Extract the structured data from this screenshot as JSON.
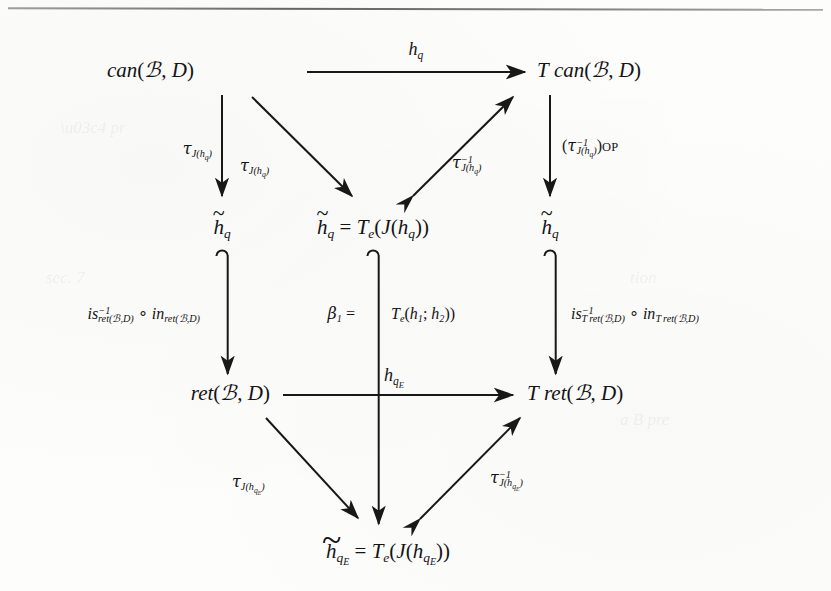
{
  "figure": {
    "kind": "commutative-diagram",
    "top_rule": true,
    "nodes": {
      "can": "can(ℐ, D)",
      "tcan": "T can(ℐ, D)",
      "h_tilde_left": "h̃q",
      "h_tilde_center": "h̃q = Te(J(hq))",
      "h_tilde_right": "h̃q",
      "ret": "ret(ℐ, D)",
      "tret": "T ret(ℐ, D)",
      "h_tilde_bottom": "h̃qE = Te(J(hqE))"
    },
    "arrow_labels": {
      "top_horizontal": "hq",
      "left_vertical_outer": "τJ(hq)",
      "left_diagonal": "τJ(hq)",
      "right_diagonal": "τ⁻¹J(hq)",
      "right_vertical": "(τ⁻¹J(hq))OP",
      "left_inclusion": "is⁻¹ret(ℐ,D) ∘ inret(ℐ,D)",
      "center_inclusion": "β1 = Te(h1; h2))",
      "right_inclusion": "is⁻¹Tret(ℐ,D) ∘ inTret(ℐ,D)",
      "bottom_horizontal": "hqE",
      "bottom_left_diagonal": "τJ(hqE)",
      "bottom_right_diagonal": "τ⁻¹J(hqE)"
    }
  }
}
